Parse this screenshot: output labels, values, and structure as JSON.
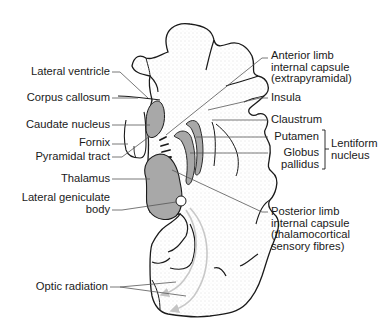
{
  "diagram": {
    "colors": {
      "outline": "#1a1a1a",
      "structure_fill": "#a8a8a8",
      "stipple": "#bdbdbd",
      "leader_line": "#555555",
      "optic_radiation_arrow": "#c8c8c8",
      "text": "#1a1a1a"
    },
    "labels_left": [
      {
        "id": "lateral-ventricle",
        "lines": [
          "Lateral ventricle"
        ]
      },
      {
        "id": "corpus-callosum",
        "lines": [
          "Corpus callosum"
        ]
      },
      {
        "id": "caudate-nucleus",
        "lines": [
          "Caudate nucleus"
        ]
      },
      {
        "id": "fornix",
        "lines": [
          "Fornix"
        ]
      },
      {
        "id": "pyramidal-tract",
        "lines": [
          "Pyramidal tract"
        ]
      },
      {
        "id": "thalamus",
        "lines": [
          "Thalamus"
        ]
      },
      {
        "id": "lateral-geniculate-body",
        "lines": [
          "Lateral geniculate",
          "body"
        ]
      },
      {
        "id": "optic-radiation",
        "lines": [
          "Optic radiation"
        ]
      }
    ],
    "labels_right": [
      {
        "id": "anterior-limb",
        "lines": [
          "Anterior limb",
          "internal capsule",
          "(extrapyramidal)"
        ]
      },
      {
        "id": "insula",
        "lines": [
          "Insula"
        ]
      },
      {
        "id": "claustrum",
        "lines": [
          "Claustrum"
        ]
      },
      {
        "id": "putamen",
        "lines": [
          "Putamen"
        ]
      },
      {
        "id": "globus-pallidus",
        "lines": [
          "Globus",
          "pallidus"
        ]
      },
      {
        "id": "lentiform-nucleus",
        "lines": [
          "Lentiform",
          "nucleus"
        ]
      },
      {
        "id": "posterior-limb",
        "lines": [
          "Posterior limb",
          "internal capsule",
          "(thalamocortical",
          "sensory fibres)"
        ]
      }
    ]
  }
}
